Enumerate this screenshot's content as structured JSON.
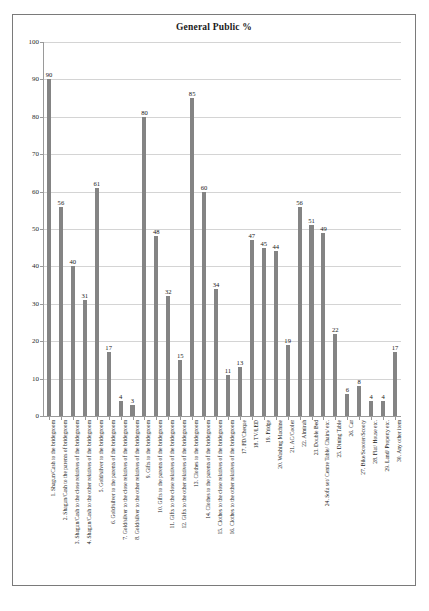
{
  "chart": {
    "title": "General Public %"
  },
  "chart_data": {
    "type": "bar",
    "title": "General Public %",
    "xlabel": "",
    "ylabel": "",
    "ylim": [
      0,
      100
    ],
    "ytick_labels": [
      "0",
      "10",
      "20",
      "30",
      "40",
      "50",
      "60",
      "70",
      "80",
      "90",
      "100"
    ],
    "ytick_values": [
      0,
      10,
      20,
      30,
      40,
      50,
      60,
      70,
      80,
      90,
      100
    ],
    "grid": true,
    "legend": false,
    "bar_color": "#848484",
    "categories": [
      "1.   Shagun/Cash to the bridegroom",
      "2.   Shagun/Cash to the parents of bridegroom",
      "3.   Shagun/Cash to the close relatives of the bridegroom",
      "4.   Shagun/Cash to the other relatives of the bridegroom",
      "5.   Gold/silver to the bridegroom",
      "6.   Gold/silver to the parents of the bridegroom",
      "7.   Gold/silver to the close relatives of the bridegroom",
      "8.   Gold/silver to the other relatives of the bridegroom",
      "9.   Gifts to the bridegroom",
      "10.  Gifts to the parents of the bridegroom",
      "11.  Gifts to the close relatives of the bridegroom",
      "12.  Gifts to the other relatives of the bridegroom",
      "13.  Clothes to the bridegroom",
      "14.  Clothes to the parents of the bridegroom",
      "15.  Clothes to the close relatives of the bridegroom",
      "16.  Clothes to the other relatives of the bridegroom",
      "17.  FD/Cheque",
      "18.  TV/LED",
      "19.  Fridge",
      "20.  Washing Machine",
      "21.  AC/Cooler",
      "22.  Almirah",
      "23.  Double Bed",
      "24.  Sofa set/ Centre Table/ Chairs/ etc.",
      "25.  Dining Table",
      "26.  Car",
      "27.  Bike/Scooter/Scooty",
      "28.  Flat/ House etc.",
      "29.  Land/ Property etc.",
      "30.  Any other item"
    ],
    "values": [
      90,
      56,
      40,
      31,
      61,
      17,
      4,
      3,
      80,
      48,
      32,
      15,
      85,
      60,
      34,
      11,
      13,
      47,
      45,
      44,
      19,
      56,
      51,
      49,
      22,
      6,
      8,
      4,
      4,
      17
    ]
  }
}
